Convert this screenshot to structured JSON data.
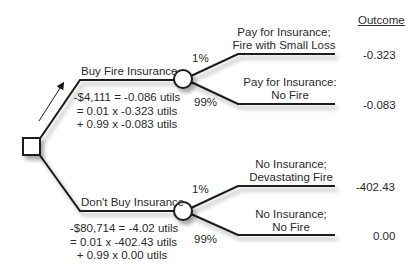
{
  "header": {
    "outcome_label": "Outcome"
  },
  "decision": {
    "options": [
      {
        "label": "Buy Fire Insurance",
        "calc": [
          "-$4,111 = -0.086 utils",
          "= 0.01 x -0.323 utils",
          "+ 0.99 x -0.083 utils"
        ],
        "branches": [
          {
            "prob": "1%",
            "label_lines": [
              "Pay for Insurance;",
              "Fire with Small Loss"
            ],
            "outcome": "-0.323"
          },
          {
            "prob": "99%",
            "label_lines": [
              "Pay for Insurance:",
              "No Fire"
            ],
            "outcome": "-0.083"
          }
        ]
      },
      {
        "label": "Don't Buy Insurance",
        "calc": [
          "-$80,714 = -4.02 utils",
          "= 0.01 x -402.43 utils",
          "+ 0.99 x 0.00 utils"
        ],
        "branches": [
          {
            "prob": "1%",
            "label_lines": [
              "No Insurance;",
              "Devastating Fire"
            ],
            "outcome": "-402.43"
          },
          {
            "prob": "99%",
            "label_lines": [
              "No Insurance;",
              "No Fire"
            ],
            "outcome": "0.00"
          }
        ]
      }
    ]
  },
  "colors": {
    "line": "#1a1a1a",
    "node_fill": "#ffffff",
    "shadow": "#bbbbbb"
  }
}
